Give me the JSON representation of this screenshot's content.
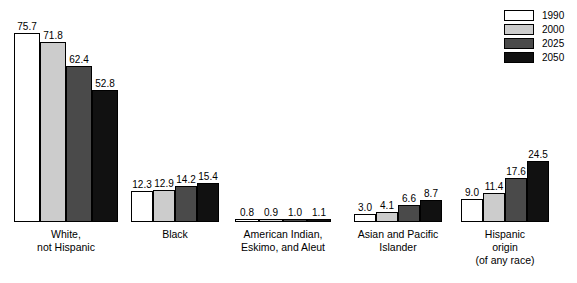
{
  "chart_data": {
    "type": "bar",
    "title": "",
    "subtitle": "",
    "xlabel": "",
    "ylabel": "",
    "grid": false,
    "legend_position": "top-right",
    "ylim": [
      0,
      80
    ],
    "categories": [
      "White, not Hispanic",
      "Black",
      "American Indian, Eskimo, and Aleut",
      "Asian and Pacific Islander",
      "Hispanic origin (of any race)"
    ],
    "series": [
      {
        "name": "1990",
        "color": "#ffffff",
        "values": [
          75.7,
          12.3,
          0.8,
          3.0,
          9.0
        ]
      },
      {
        "name": "2000",
        "color": "#cccccc",
        "values": [
          71.8,
          12.9,
          0.9,
          4.1,
          11.4
        ]
      },
      {
        "name": "2025",
        "color": "#4a4a4a",
        "values": [
          62.4,
          14.2,
          1.0,
          6.6,
          17.6
        ]
      },
      {
        "name": "2050",
        "color": "#111111",
        "values": [
          52.8,
          15.4,
          1.1,
          8.7,
          24.5
        ]
      }
    ]
  },
  "legend": {
    "items": [
      {
        "label": "1990",
        "color": "#ffffff"
      },
      {
        "label": "2000",
        "color": "#cccccc"
      },
      {
        "label": "2025",
        "color": "#4a4a4a"
      },
      {
        "label": "2050",
        "color": "#111111"
      }
    ]
  },
  "groups": [
    {
      "label_lines": [
        "White,",
        "not Hispanic"
      ],
      "center": 66,
      "bar_width": 26,
      "values": [
        "75.7",
        "71.8",
        "62.4",
        "52.8"
      ],
      "numeric": [
        75.7,
        71.8,
        62.4,
        52.8
      ]
    },
    {
      "label_lines": [
        "Black"
      ],
      "center": 175,
      "bar_width": 22,
      "values": [
        "12.3",
        "12.9",
        "14.2",
        "15.4"
      ],
      "numeric": [
        12.3,
        12.9,
        14.2,
        15.4
      ]
    },
    {
      "label_lines": [
        "American Indian,",
        "Eskimo, and Aleut"
      ],
      "center": 283,
      "bar_width": 24,
      "values": [
        "0.8",
        "0.9",
        "1.0",
        "1.1"
      ],
      "numeric": [
        0.8,
        0.9,
        1.0,
        1.1
      ]
    },
    {
      "label_lines": [
        "Asian and Pacific",
        "Islander"
      ],
      "center": 398,
      "bar_width": 22,
      "values": [
        "3.0",
        "4.1",
        "6.6",
        "8.7"
      ],
      "numeric": [
        3.0,
        4.1,
        6.6,
        8.7
      ]
    },
    {
      "label_lines": [
        "Hispanic",
        "origin",
        "(of any race)"
      ],
      "center": 505,
      "bar_width": 22,
      "values": [
        "9.0",
        "11.4",
        "17.6",
        "24.5"
      ],
      "numeric": [
        9.0,
        11.4,
        17.6,
        24.5
      ]
    }
  ],
  "scale": {
    "pixels_per_unit": 2.5
  }
}
